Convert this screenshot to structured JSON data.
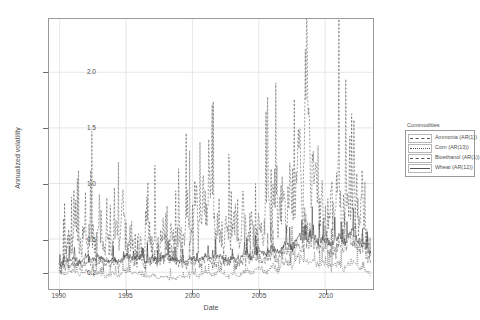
{
  "chart_data": {
    "type": "line",
    "title": "",
    "xlabel": "Date",
    "ylabel": "Annualized volatility",
    "xlim": [
      1989.2,
      2013.6
    ],
    "ylim": [
      0.05,
      2.48
    ],
    "xticks": [
      1990,
      1995,
      2000,
      2005,
      2010
    ],
    "yticks": [
      0.2,
      0.5,
      1.0,
      1.5,
      2.0
    ],
    "ytick_labels": [
      "0.2",
      "0.5",
      "1.0",
      "1.5",
      "2.0"
    ],
    "xtick_labels": [
      "1990",
      "1995",
      "2000",
      "2005",
      "2010"
    ],
    "grid": true,
    "legend_position": "right",
    "legend_title": "Commodities",
    "series": [
      {
        "name": "Ammonia (AR(1))",
        "style": "dashed",
        "color": "#555555",
        "x": [
          1990.0,
          1990.3,
          1990.6,
          1990.9,
          1991.2,
          1991.5,
          1991.8,
          1992.1,
          1992.4,
          1992.7,
          1993.0,
          1993.3,
          1993.6,
          1993.9,
          1994.2,
          1994.5,
          1994.8,
          1995.1,
          1995.4,
          1995.7,
          1996.0,
          1996.3,
          1996.6,
          1996.9,
          1997.2,
          1997.5,
          1997.8,
          1998.1,
          1998.4,
          1998.7,
          1999.0,
          1999.3,
          1999.6,
          1999.9,
          2000.2,
          2000.5,
          2000.8,
          2001.1,
          2001.4,
          2001.7,
          2002.0,
          2002.3,
          2002.6,
          2002.9,
          2003.2,
          2003.5,
          2003.8,
          2004.1,
          2004.4,
          2004.7,
          2005.0,
          2005.3,
          2005.6,
          2005.9,
          2006.2,
          2006.5,
          2006.8,
          2007.1,
          2007.4,
          2007.7,
          2008.0,
          2008.3,
          2008.6,
          2008.9,
          2009.2,
          2009.5,
          2009.8,
          2010.1,
          2010.4,
          2010.7,
          2011.0,
          2011.3,
          2011.6,
          2011.9,
          2012.2,
          2012.5,
          2012.8,
          2013.1,
          2013.4
        ],
        "y": [
          0.26,
          0.3,
          0.55,
          0.42,
          0.7,
          0.38,
          0.62,
          0.45,
          0.58,
          0.36,
          0.75,
          0.4,
          0.52,
          0.34,
          0.64,
          0.42,
          0.8,
          0.38,
          0.55,
          0.33,
          0.48,
          0.39,
          0.72,
          0.44,
          0.58,
          0.36,
          0.66,
          0.41,
          0.55,
          0.38,
          0.62,
          0.45,
          0.85,
          0.48,
          1.05,
          0.52,
          0.95,
          0.58,
          1.15,
          0.55,
          0.72,
          0.46,
          0.6,
          0.42,
          0.68,
          0.44,
          0.75,
          0.48,
          0.62,
          0.44,
          0.7,
          0.52,
          0.88,
          0.55,
          1.02,
          0.58,
          0.92,
          0.62,
          1.1,
          0.66,
          1.35,
          0.85,
          2.38,
          0.95,
          1.25,
          0.7,
          0.88,
          0.58,
          0.95,
          0.62,
          1.15,
          0.66,
          0.85,
          0.55,
          1.2,
          0.62,
          0.9,
          0.48,
          0.4
        ]
      },
      {
        "name": "Corn (AR(13))",
        "style": "dashdot",
        "color": "#555555",
        "x": [
          1990.0,
          1990.5,
          1991.0,
          1991.5,
          1992.0,
          1992.5,
          1993.0,
          1993.5,
          1994.0,
          1994.5,
          1995.0,
          1995.5,
          1996.0,
          1996.5,
          1997.0,
          1997.5,
          1998.0,
          1998.5,
          1999.0,
          1999.5,
          2000.0,
          2000.5,
          2001.0,
          2001.5,
          2002.0,
          2002.5,
          2003.0,
          2003.5,
          2004.0,
          2004.5,
          2005.0,
          2005.5,
          2006.0,
          2006.5,
          2007.0,
          2007.5,
          2008.0,
          2008.5,
          2009.0,
          2009.5,
          2010.0,
          2010.5,
          2011.0,
          2011.5,
          2012.0,
          2012.5,
          2013.0,
          2013.4
        ],
        "y": [
          0.22,
          0.25,
          0.28,
          0.24,
          0.3,
          0.26,
          0.32,
          0.27,
          0.29,
          0.25,
          0.34,
          0.28,
          0.31,
          0.26,
          0.3,
          0.27,
          0.33,
          0.29,
          0.28,
          0.25,
          0.3,
          0.27,
          0.32,
          0.28,
          0.31,
          0.27,
          0.3,
          0.28,
          0.34,
          0.3,
          0.33,
          0.29,
          0.36,
          0.32,
          0.4,
          0.36,
          0.45,
          0.42,
          0.48,
          0.4,
          0.44,
          0.38,
          0.46,
          0.4,
          0.5,
          0.42,
          0.38,
          0.3
        ]
      },
      {
        "name": "Bioethanol (AR(1))",
        "style": "dotted",
        "color": "#444444",
        "x": [
          1990.0,
          1990.5,
          1991.0,
          1991.5,
          1992.0,
          1992.5,
          1993.0,
          1993.5,
          1994.0,
          1994.5,
          1995.0,
          1995.5,
          1996.0,
          1996.5,
          1997.0,
          1997.5,
          1998.0,
          1998.5,
          1999.0,
          1999.5,
          2000.0,
          2000.5,
          2001.0,
          2001.5,
          2002.0,
          2002.5,
          2003.0,
          2003.5,
          2004.0,
          2004.5,
          2005.0,
          2005.5,
          2006.0,
          2006.5,
          2007.0,
          2007.5,
          2008.0,
          2008.5,
          2009.0,
          2009.5,
          2010.0,
          2010.5,
          2011.0,
          2011.5,
          2012.0,
          2012.5,
          2013.0,
          2013.4
        ],
        "y": [
          0.2,
          0.19,
          0.22,
          0.18,
          0.21,
          0.17,
          0.2,
          0.16,
          0.19,
          0.17,
          0.22,
          0.18,
          0.2,
          0.16,
          0.18,
          0.15,
          0.17,
          0.14,
          0.16,
          0.15,
          0.19,
          0.16,
          0.21,
          0.17,
          0.2,
          0.16,
          0.18,
          0.17,
          0.22,
          0.19,
          0.24,
          0.2,
          0.26,
          0.22,
          0.3,
          0.25,
          0.34,
          0.28,
          0.32,
          0.26,
          0.29,
          0.24,
          0.28,
          0.23,
          0.3,
          0.25,
          0.22,
          0.18
        ]
      },
      {
        "name": "Wheat (AR(12))",
        "style": "solid",
        "color": "#3a3a3a",
        "x": [
          1990.0,
          1990.5,
          1991.0,
          1991.5,
          1992.0,
          1992.5,
          1993.0,
          1993.5,
          1994.0,
          1994.5,
          1995.0,
          1995.5,
          1996.0,
          1996.5,
          1997.0,
          1997.5,
          1998.0,
          1998.5,
          1999.0,
          1999.5,
          2000.0,
          2000.5,
          2001.0,
          2001.5,
          2002.0,
          2002.5,
          2003.0,
          2003.5,
          2004.0,
          2004.5,
          2005.0,
          2005.5,
          2006.0,
          2006.5,
          2007.0,
          2007.5,
          2008.0,
          2008.5,
          2009.0,
          2009.5,
          2010.0,
          2010.5,
          2011.0,
          2011.5,
          2012.0,
          2012.5,
          2013.0,
          2013.4
        ],
        "y": [
          0.27,
          0.3,
          0.33,
          0.29,
          0.35,
          0.31,
          0.34,
          0.3,
          0.32,
          0.29,
          0.36,
          0.32,
          0.34,
          0.3,
          0.33,
          0.31,
          0.35,
          0.32,
          0.31,
          0.29,
          0.33,
          0.3,
          0.36,
          0.32,
          0.35,
          0.31,
          0.33,
          0.32,
          0.38,
          0.34,
          0.4,
          0.36,
          0.42,
          0.38,
          0.46,
          0.42,
          0.52,
          0.48,
          0.55,
          0.47,
          0.5,
          0.44,
          0.52,
          0.46,
          0.56,
          0.48,
          0.44,
          0.36
        ]
      }
    ]
  },
  "legend": {
    "title": "Commodities",
    "entries": [
      {
        "label": "Ammonia (AR(1))",
        "key": "d1"
      },
      {
        "label": "Corn (AR(13))",
        "key": "d2"
      },
      {
        "label": "Bioethanol (AR(1))",
        "key": "d3"
      },
      {
        "label": "Wheat (AR(12))",
        "key": "d4"
      }
    ]
  }
}
